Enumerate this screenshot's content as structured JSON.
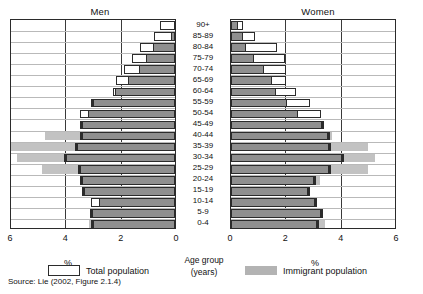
{
  "chart_data": {
    "type": "bar",
    "subtype": "population-pyramid",
    "title": "",
    "panels": [
      {
        "name": "men",
        "label": "Men",
        "direction": "left",
        "xlabel": "%"
      },
      {
        "name": "women",
        "label": "Women",
        "direction": "right",
        "xlabel": "%"
      }
    ],
    "categories": [
      "90+",
      "85-89",
      "80-84",
      "75-79",
      "70-74",
      "65-69",
      "60-64",
      "55-59",
      "50-54",
      "45-49",
      "40-44",
      "35-39",
      "30-34",
      "25-29",
      "20-24",
      "15-19",
      "10-14",
      "5-9",
      "0-4"
    ],
    "category_axis_label": "Age group",
    "category_axis_sublabel": "(years)",
    "xlim": [
      0,
      6
    ],
    "xticks": [
      0,
      2,
      4,
      6
    ],
    "men_xticks": [
      6,
      4,
      2,
      0
    ],
    "women_xticks": [
      0,
      2,
      4,
      6
    ],
    "grid": true,
    "legend": [
      "Total population",
      "Immigrant population"
    ],
    "legend_position": "bottom",
    "series": [
      {
        "name": "Total population",
        "panel": "men",
        "values": [
          0.55,
          0.75,
          1.25,
          1.55,
          1.85,
          2.15,
          2.25,
          2.95,
          3.45,
          3.35,
          3.35,
          3.55,
          3.95,
          3.45,
          3.35,
          3.3,
          3.05,
          3.0,
          2.95
        ]
      },
      {
        "name": "Immigrant population",
        "panel": "men",
        "values": [
          0.0,
          0.1,
          0.75,
          1.0,
          1.25,
          1.65,
          2.15,
          2.95,
          3.1,
          3.35,
          4.7,
          5.95,
          5.7,
          4.8,
          3.35,
          3.3,
          2.7,
          3.0,
          3.1
        ]
      },
      {
        "name": "Total population",
        "panel": "women",
        "values": [
          0.45,
          0.85,
          1.65,
          1.95,
          2.0,
          2.0,
          2.35,
          2.85,
          3.25,
          3.3,
          3.5,
          3.55,
          4.0,
          3.55,
          3.0,
          2.8,
          3.05,
          3.25,
          3.1
        ]
      },
      {
        "name": "Immigrant population",
        "panel": "women",
        "values": [
          0.2,
          0.4,
          0.5,
          0.8,
          1.15,
          1.45,
          1.6,
          2.0,
          2.4,
          3.3,
          3.65,
          4.95,
          5.2,
          4.95,
          3.2,
          2.8,
          3.05,
          3.25,
          3.4
        ]
      }
    ]
  },
  "header": {
    "men_title": "Men",
    "women_title": "Women"
  },
  "axis": {
    "men_ticks": [
      "6",
      "4",
      "2",
      "0"
    ],
    "women_ticks": [
      "0",
      "2",
      "4",
      "6"
    ],
    "men_percent_label": "%",
    "women_percent_label": "%"
  },
  "center": {
    "age_group_label": "Age group",
    "years_label": "(years)"
  },
  "legend": {
    "total_label": "Total population",
    "immigrant_label": "Immigrant population"
  },
  "footer": {
    "source": "Source:  Lie (2002, Figure 2.1.4)"
  },
  "colors": {
    "immigrant_dark": "#8f8f8f",
    "immigrant_light": "#c2c2c2",
    "total_fill": "#ffffff",
    "outline": "#2b2b2b",
    "gridline": "#3a3a3a"
  }
}
